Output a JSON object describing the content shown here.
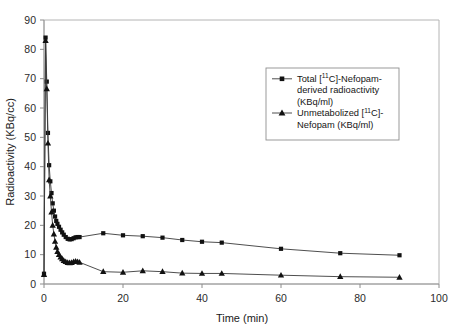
{
  "chart_data": {
    "type": "line",
    "title": "",
    "xlabel": "Time (min)",
    "ylabel": "Radioactivity (KBq/cc)",
    "xlim": [
      0,
      100
    ],
    "ylim": [
      0,
      90
    ],
    "xticks": [
      0,
      20,
      40,
      60,
      80,
      100
    ],
    "yticks": [
      0,
      10,
      20,
      30,
      40,
      50,
      60,
      70,
      80,
      90
    ],
    "grid": false,
    "legend_position": "upper-right-inside",
    "series": [
      {
        "name": "Total [11C]-Nefopam-derived radioactivity (KBq/ml)",
        "marker": "square",
        "color": "#111111",
        "x": [
          0.0,
          0.4,
          0.7,
          1.0,
          1.3,
          1.6,
          1.9,
          2.2,
          2.5,
          2.8,
          3.1,
          3.4,
          3.8,
          4.2,
          4.6,
          5.0,
          5.5,
          6.0,
          6.5,
          7.0,
          7.5,
          8.0,
          8.5,
          9.0,
          15.0,
          20.0,
          25.0,
          30.0,
          35.0,
          40.0,
          45.0,
          60.0,
          75.0,
          90.0
        ],
        "y": [
          3.5,
          84.0,
          69.0,
          51.5,
          40.5,
          35.0,
          31.0,
          27.5,
          25.0,
          23.0,
          21.5,
          20.5,
          19.5,
          18.5,
          17.6,
          16.8,
          16.0,
          15.4,
          15.2,
          15.3,
          15.6,
          15.9,
          16.0,
          16.0,
          17.3,
          16.6,
          16.3,
          15.8,
          15.0,
          14.4,
          14.1,
          12.0,
          10.5,
          9.8
        ]
      },
      {
        "name": "Unmetabolized [11C]-Nefopam (KBq/ml)",
        "marker": "triangle",
        "color": "#111111",
        "x": [
          0.0,
          0.4,
          0.7,
          1.0,
          1.3,
          1.6,
          1.9,
          2.2,
          2.5,
          2.8,
          3.1,
          3.4,
          3.8,
          4.2,
          4.6,
          5.0,
          5.5,
          6.0,
          6.5,
          7.0,
          7.5,
          8.0,
          8.5,
          9.0,
          15.0,
          20.0,
          25.0,
          30.0,
          35.0,
          40.0,
          45.0,
          60.0,
          75.0,
          90.0
        ],
        "y": [
          3.2,
          83.0,
          66.5,
          48.0,
          35.5,
          30.0,
          24.5,
          20.0,
          17.0,
          14.5,
          12.5,
          11.0,
          10.0,
          9.2,
          8.6,
          8.0,
          7.6,
          7.3,
          7.2,
          7.3,
          7.6,
          7.7,
          7.6,
          7.4,
          4.2,
          4.0,
          4.5,
          4.2,
          3.7,
          3.6,
          3.6,
          3.0,
          2.5,
          2.3
        ]
      }
    ]
  },
  "legend": {
    "entries": [
      {
        "marker": "square",
        "lines": [
          {
            "pre": "Total [",
            "sup": "11",
            "mid": "C]-Nefopam-",
            "post": ""
          },
          {
            "pre": "derived radioactivity",
            "sup": "",
            "mid": "",
            "post": ""
          },
          {
            "pre": "(KBq/ml)",
            "sup": "",
            "mid": "",
            "post": ""
          }
        ]
      },
      {
        "marker": "triangle",
        "lines": [
          {
            "pre": "Unmetabolized [",
            "sup": "11",
            "mid": "C]-",
            "post": ""
          },
          {
            "pre": "Nefopam (KBq/ml)",
            "sup": "",
            "mid": "",
            "post": ""
          }
        ]
      }
    ]
  },
  "axes": {
    "x_title": "Time (min)",
    "y_title": "Radioactivity (KBq/cc)",
    "x_tick_labels": [
      "0",
      "20",
      "40",
      "60",
      "80",
      "100"
    ],
    "y_tick_labels": [
      "0",
      "10",
      "20",
      "30",
      "40",
      "50",
      "60",
      "70",
      "80",
      "90"
    ]
  },
  "colors": {
    "marker": "#111111",
    "line": "#3a3a3a",
    "frame": "#b4b4b4",
    "axis": "#9a9a9a",
    "background": "#ffffff"
  }
}
